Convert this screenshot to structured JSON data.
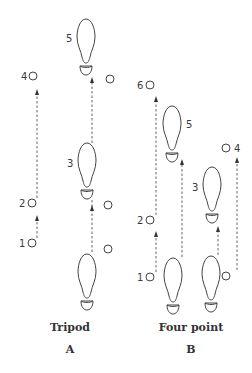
{
  "diagram": {
    "colors": {
      "stroke": "#444444",
      "text": "#333333",
      "background": "#ffffff"
    },
    "panels": [
      {
        "id": "A",
        "name": "Tripod",
        "letter": "A",
        "step_labels": [
          "1",
          "2",
          "3",
          "4",
          "5"
        ],
        "elements": [
          {
            "type": "crutch-point",
            "label": "1"
          },
          {
            "type": "crutch-point",
            "label": "2"
          },
          {
            "type": "footprint",
            "label": "3"
          },
          {
            "type": "crutch-point",
            "label": "4"
          },
          {
            "type": "footprint",
            "label": "5"
          }
        ]
      },
      {
        "id": "B",
        "name": "Four point",
        "letter": "B",
        "step_labels": [
          "1",
          "2",
          "3",
          "4",
          "5",
          "6"
        ],
        "elements": [
          {
            "type": "crutch-point",
            "label": "1"
          },
          {
            "type": "crutch-point",
            "label": "2"
          },
          {
            "type": "footprint",
            "label": "3"
          },
          {
            "type": "crutch-point",
            "label": "4"
          },
          {
            "type": "footprint",
            "label": "5"
          },
          {
            "type": "crutch-point",
            "label": "6"
          }
        ]
      }
    ]
  }
}
